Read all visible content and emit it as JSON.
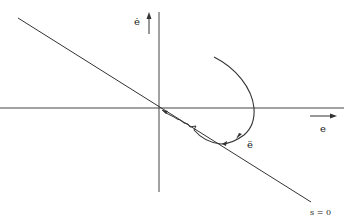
{
  "diagram": {
    "axes": {
      "horizontal_label": "e",
      "vertical_label": "ė"
    },
    "sliding_line_label": "s = 0",
    "trajectory_label": "ë",
    "colors": {
      "background": "#ffffff",
      "stroke": "#333333",
      "text": "#222222"
    }
  }
}
